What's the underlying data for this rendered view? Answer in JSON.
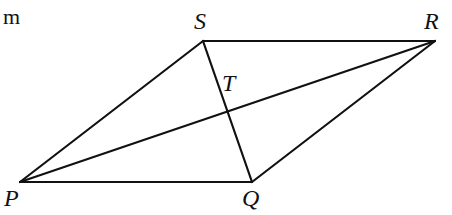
{
  "corner_label": "m",
  "figure": {
    "type": "parallelogram with diagonals",
    "line_color": "#111111",
    "vertices": {
      "S": {
        "label": "S",
        "x": 203,
        "y": 41
      },
      "R": {
        "label": "R",
        "x": 435,
        "y": 41
      },
      "P": {
        "label": "P",
        "x": 20,
        "y": 182
      },
      "Q": {
        "label": "Q",
        "x": 252,
        "y": 182
      },
      "T": {
        "label": "T"
      }
    },
    "segments": [
      "SR",
      "RQ",
      "QP",
      "PS",
      "PR",
      "SQ"
    ]
  }
}
